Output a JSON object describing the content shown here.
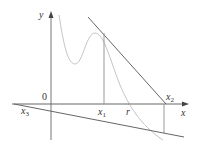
{
  "diagram": {
    "type": "newtons-method-failure",
    "labels": {
      "y_axis": "y",
      "x_axis": "x",
      "origin": "0",
      "x1": {
        "base": "x",
        "sub": "1"
      },
      "x2": {
        "base": "x",
        "sub": "2"
      },
      "x3": {
        "base": "x",
        "sub": "3"
      },
      "root": "r"
    },
    "colors": {
      "axes": "#555555",
      "curve": "#bbbbbb",
      "tangent": "#666666",
      "vertical": "#888888",
      "text": "#333333"
    }
  }
}
